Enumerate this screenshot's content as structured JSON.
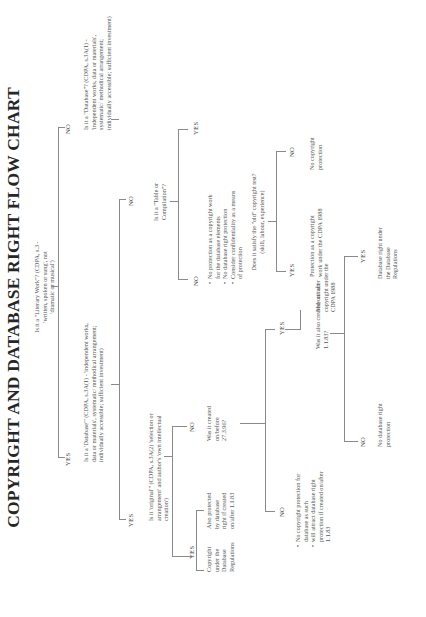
{
  "document": {
    "title": "COPYRIGHT AND DATABASE RIGHT FLOW CHART",
    "orientation": "rotated 90° counter-clockwise (landscape page)"
  },
  "nodes": {
    "q_literary": "Is it a \"Literary Work\"? (CDPA, s.3 - 'written, spoken or sung', not 'dramatic or musical')",
    "q_database_yes": "Is it a 'Database'\" (CDPA, s.3A(1) - 'independent works, data or materials', systematic/ methodical arrangement; individually accessible; sufficient investment)",
    "q_database_no": "Is it a \"Database\"? (CDPA, s.3A(1) - 'independent works, data or materials', systematic/ methodical arrangement; individually accessible; sufficient investment)",
    "q_original": "Is it 'original'\" (CDPA, s.3A(2) 'selection or arrangement' and author's 'own intellectual creation')",
    "copyright_under_regs": "Copyright under the Database Regulations",
    "also_protected": "Also protected by database right if created on/after 1.1.83",
    "q_created_before_27390": "Was it created on/before 27.3.96?",
    "no_protection_list": [
      "No copyright protection for database as such",
      "will attract database right protection if created on/after 1.1.83"
    ],
    "q_also_created_after": "Was it also created on/ after 1.1.83?",
    "no_db_right_protection": "No database right protection",
    "db_right_under_regs": "Database right under the Database Regulations",
    "may_attract": "May attract copyright under the CDPA 1988",
    "q_table_compilation": "Is it a \"Table or Compilation\"?",
    "table_no_list": [
      "No protection as a copyright work for the database elements",
      "No database right protection",
      "Consider confidentiality as a means of protection"
    ],
    "q_old_test": "Does it satisfy the \"old\" copyright test? (skill, labour, experience)",
    "protection_as_copyright": "Protection as a copyright work under the CDPA 1988",
    "no_copyright_protection": "No copyright protection",
    "q_created_after_1183": "Was it created on or after 1.1.83",
    "no_db_right_consider": "No database right protection. Consider copyright",
    "will_attract": "It will attract database right protection",
    "not_db_list": [
      "It will not attract database right",
      "Is it some other kind of copyright work? (CDPA s.1 eg collage, sound recording)"
    ],
    "q_created_before_27396b": "Was it created on/ before 27.3.96?",
    "work_not_attract_list": [
      "The work will not attract copyright/database right.",
      "Consider confidentiality as a means of protection"
    ],
    "conflict_note": "There is conflict between the Database Regulations and the Database Directive. Under the Database Directive the new \"originality\" test should apply to all copyright for databases. Under the Database Regulations, this has only been implemented for those which are literary works."
  },
  "labels": {
    "yes": "YES",
    "no": "NO"
  },
  "colors": {
    "text": "#555555",
    "title": "#262626",
    "lines": "#8a8a8a",
    "background": "#ffffff"
  }
}
